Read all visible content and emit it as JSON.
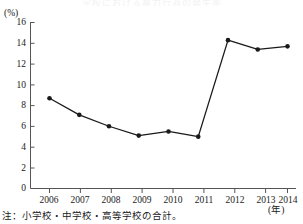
{
  "figure": {
    "title_remnant": "学校における暴力行為の発生率",
    "y_unit_label": "(%)",
    "x_unit_label": "(年)",
    "note": "注：小学校・中学校・高等学校の合計。",
    "line_color": "#1a1a1a",
    "marker_color": "#1a1a1a",
    "axis_color": "#555555"
  },
  "chart_data": {
    "type": "line",
    "title": "",
    "xlabel": "(年)",
    "ylabel": "(%)",
    "categories": [
      "2006",
      "2007",
      "2008",
      "2009",
      "2010",
      "2011",
      "2012",
      "2013",
      "2014"
    ],
    "values": [
      8.7,
      7.1,
      6.0,
      5.1,
      5.5,
      5.0,
      14.3,
      13.4,
      13.7
    ],
    "series": [
      {
        "name": "小学校・中学校・高等学校の合計",
        "values": [
          8.7,
          7.1,
          6.0,
          5.1,
          5.5,
          5.0,
          14.3,
          13.4,
          13.7
        ]
      }
    ],
    "ylim": [
      0,
      16
    ],
    "yticks": [
      0,
      2,
      4,
      6,
      8,
      10,
      12,
      14,
      16
    ],
    "ytick_labels": [
      "0",
      "2",
      "4",
      "6",
      "8",
      "10",
      "12",
      "14",
      "16"
    ],
    "xtick_labels": [
      "2006",
      "2007",
      "2008",
      "2009",
      "2010",
      "2011",
      "2012",
      "2013",
      "2014"
    ],
    "grid": false,
    "legend": false,
    "markers": "filled-circle"
  }
}
